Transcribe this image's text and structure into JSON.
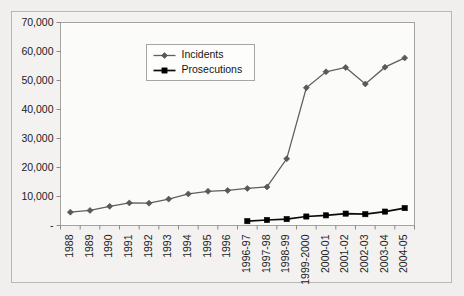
{
  "chart_data": {
    "type": "line",
    "title": "",
    "xlabel": "",
    "ylabel": "",
    "ylim": [
      0,
      70000
    ],
    "grid": false,
    "legend_position": "upper-left-inside",
    "ytick_labels": [
      "70,000",
      "60,000",
      "50,000",
      "40,000",
      "30,000",
      "20,000",
      "10,000",
      "-"
    ],
    "ytick_values": [
      70000,
      60000,
      50000,
      40000,
      30000,
      20000,
      10000,
      0
    ],
    "categories": [
      "1988",
      "1989",
      "1990",
      "1991",
      "1992",
      "1993",
      "1994",
      "1995",
      "1996",
      "1996-97",
      "1997-98",
      "1998-99",
      "1999-2000",
      "2000-01",
      "2001-02",
      "2002-03",
      "2003-04",
      "2004-05"
    ],
    "series": [
      {
        "name": "Incidents",
        "color": "#5f5f5f",
        "marker": "diamond",
        "values": [
          4600,
          5200,
          6600,
          7800,
          7700,
          9100,
          10900,
          11800,
          12100,
          12800,
          13300,
          23000,
          47500,
          53000,
          54500,
          48800,
          54600,
          57800
        ]
      },
      {
        "name": "Prosecutions",
        "color": "#000000",
        "marker": "square",
        "values": [
          null,
          null,
          null,
          null,
          null,
          null,
          null,
          null,
          null,
          1500,
          1900,
          2200,
          3100,
          3500,
          4100,
          3900,
          4800,
          6000
        ]
      }
    ],
    "legend": [
      {
        "label": "Incidents",
        "color": "#5f5f5f",
        "marker": "diamond"
      },
      {
        "label": "Prosecutions",
        "color": "#000000",
        "marker": "square"
      }
    ]
  },
  "colors": {
    "page_background": "#f0efee",
    "frame_background": "#f3f2f1",
    "plot_background": "#fbfbfa",
    "axis": "#8d8b88",
    "incidents": "#5f5f5f",
    "prosecutions": "#000000"
  }
}
